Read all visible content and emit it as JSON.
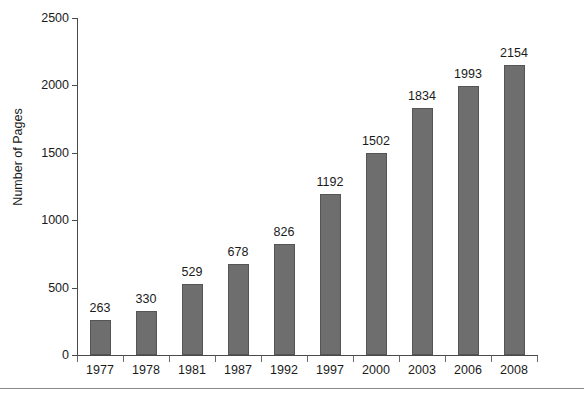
{
  "chart_data": {
    "type": "bar",
    "title": "",
    "xlabel": "",
    "ylabel": "Number of Pages",
    "categories": [
      "1977",
      "1978",
      "1981",
      "1987",
      "1992",
      "1997",
      "2000",
      "2003",
      "2006",
      "2008"
    ],
    "values": [
      263,
      330,
      529,
      678,
      826,
      1192,
      1502,
      1834,
      1993,
      2154
    ],
    "data_labels": [
      "263",
      "330",
      "529",
      "678",
      "826",
      "1192",
      "1502",
      "1834",
      "1993",
      "2154"
    ],
    "ylim": [
      0,
      2500
    ],
    "y_ticks": [
      0,
      500,
      1000,
      1500,
      2000,
      2500
    ],
    "y_tick_labels": [
      "0",
      "500",
      "1000",
      "1500",
      "2000",
      "2500"
    ],
    "grid": false,
    "legend": null,
    "bar_color": "#6e6e6e",
    "bar_edge_color": "#555555",
    "axis_color": "#4a4a4a",
    "text_color": "#1a1a1a"
  },
  "figure": {
    "background": "#ffffff",
    "bottom_rule_color": "#8a8a8a"
  }
}
